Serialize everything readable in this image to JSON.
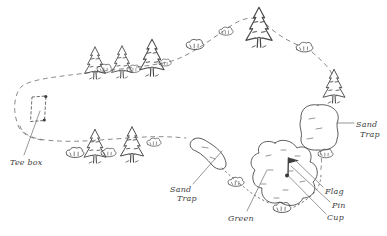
{
  "diagram": {
    "background_color": "#ffffff",
    "ink_color": "#4a4a4a",
    "labels": {
      "tee_box": "Tee box",
      "fairway_sand_trap_line1": "Sand",
      "fairway_sand_trap_line2": "Trap",
      "green": "Green",
      "right_sand_trap_line1": "Sand",
      "right_sand_trap_line2": "Trap",
      "flag": "Flag",
      "pin": "Pin",
      "cup": "Cup"
    },
    "features": {
      "boundary": "dashed fairway outline loop",
      "tee": "dashed tee box rectangle with corner markers",
      "trees": "pine-tree-icon x7",
      "bushes": "bush-icon x12",
      "sand_traps": 2,
      "green": "irregular green outline with grass dashes",
      "flagstick": "pin with flag and cup dot"
    }
  }
}
